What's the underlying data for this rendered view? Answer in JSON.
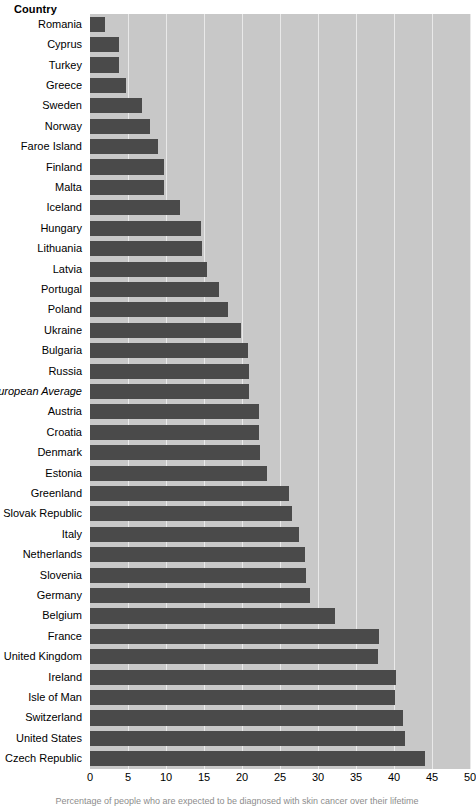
{
  "header": {
    "category_axis_title": "Country"
  },
  "caption": {
    "text": "Percentage of people who are expected to be diagnosed with skin cancer over their lifetime"
  },
  "colors": {
    "bar": "#4a4a4a",
    "plot_background": "#c8c8c8",
    "gridline": "#e9e9e9",
    "page_background": "#ffffff",
    "text": "#000000"
  },
  "chart_data": {
    "type": "bar",
    "orientation": "horizontal",
    "title": "",
    "xlabel": "",
    "ylabel": "Country",
    "xlim": [
      0,
      50
    ],
    "xticks": [
      0,
      5,
      10,
      15,
      20,
      25,
      30,
      35,
      40,
      45,
      50
    ],
    "grid": true,
    "legend": "none",
    "categories": [
      "Romania",
      "Cyprus",
      "Turkey",
      "Greece",
      "Sweden",
      "Norway",
      "Faroe Island",
      "Finland",
      "Malta",
      "Iceland",
      "Hungary",
      "Lithuania",
      "Latvia",
      "Portugal",
      "Poland",
      "Ukraine",
      "Bulgaria",
      "Russia",
      "European Average",
      "Austria",
      "Croatia",
      "Denmark",
      "Estonia",
      "Greenland",
      "Slovak Republic",
      "Italy",
      "Netherlands",
      "Slovenia",
      "Germany",
      "Belgium",
      "France",
      "United Kingdom",
      "Ireland",
      "Isle of Man",
      "Switzerland",
      "United States",
      "Czech Republic"
    ],
    "values": [
      2.0,
      3.8,
      3.8,
      4.8,
      6.8,
      7.9,
      9.0,
      9.8,
      9.7,
      11.9,
      14.6,
      14.7,
      15.4,
      17.0,
      18.1,
      19.9,
      20.8,
      20.9,
      20.9,
      22.3,
      22.3,
      22.4,
      23.3,
      26.2,
      26.6,
      27.5,
      28.3,
      28.4,
      29.0,
      32.3,
      38.0,
      37.9,
      40.2,
      40.1,
      41.2,
      41.4,
      44.1
    ],
    "emphasis_categories": [
      "European Average"
    ]
  }
}
